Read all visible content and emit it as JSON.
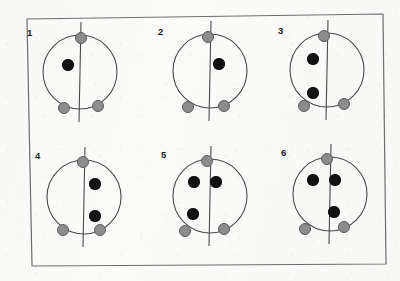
{
  "figure": {
    "width": 400,
    "height": 281,
    "background_color": "#fbfbfa",
    "frame": {
      "stroke_color": "#6e6e6e",
      "stroke_width": 1.2,
      "corners": [
        [
          27,
          19
        ],
        [
          383,
          14
        ],
        [
          386,
          264
        ],
        [
          32,
          266
        ]
      ]
    },
    "legend_colors": {
      "black_dot": "#111111",
      "gray_dot": "#8d8d8d",
      "gray_dot_outline": "#5d5d5d",
      "circle_stroke": "#4a4a4a",
      "midline_stroke": "#4a4a4a"
    },
    "geometry": {
      "circle_radius": 37,
      "black_dot_diameter": 12,
      "gray_dot_diameter": 12,
      "midline_overshoot": 13
    }
  },
  "panels": [
    {
      "label": "1",
      "label_x": 27,
      "label_y": 28,
      "center_x": 80,
      "center_y": 72,
      "radius": 37,
      "black_dot_count": 1,
      "gray_dot_count": 3,
      "black_dots": [
        {
          "x": 68,
          "y": 65,
          "name": "black-dot-left-upper"
        }
      ],
      "gray_dots": [
        {
          "x": 81,
          "y": 38,
          "name": "gray-dot-top"
        },
        {
          "x": 64,
          "y": 108,
          "name": "gray-dot-bottom-left"
        },
        {
          "x": 98,
          "y": 106,
          "name": "gray-dot-bottom-right"
        }
      ]
    },
    {
      "label": "2",
      "label_x": 158,
      "label_y": 27,
      "center_x": 210,
      "center_y": 71,
      "radius": 37,
      "black_dot_count": 1,
      "gray_dot_count": 3,
      "black_dots": [
        {
          "x": 219,
          "y": 64,
          "name": "black-dot-right-upper"
        }
      ],
      "gray_dots": [
        {
          "x": 208,
          "y": 37,
          "name": "gray-dot-top"
        },
        {
          "x": 188,
          "y": 107,
          "name": "gray-dot-bottom-left"
        },
        {
          "x": 224,
          "y": 106,
          "name": "gray-dot-bottom-right"
        }
      ]
    },
    {
      "label": "3",
      "label_x": 278,
      "label_y": 26,
      "center_x": 327,
      "center_y": 70,
      "radius": 37,
      "black_dot_count": 2,
      "gray_dot_count": 3,
      "black_dots": [
        {
          "x": 313,
          "y": 59,
          "name": "black-dot-left-upper"
        },
        {
          "x": 313,
          "y": 93,
          "name": "black-dot-left-lower"
        }
      ],
      "gray_dots": [
        {
          "x": 324,
          "y": 36,
          "name": "gray-dot-top"
        },
        {
          "x": 304,
          "y": 106,
          "name": "gray-dot-bottom-left"
        },
        {
          "x": 344,
          "y": 104,
          "name": "gray-dot-bottom-right"
        }
      ]
    },
    {
      "label": "4",
      "label_x": 35,
      "label_y": 151,
      "center_x": 84,
      "center_y": 197,
      "radius": 37,
      "black_dot_count": 2,
      "gray_dot_count": 3,
      "black_dots": [
        {
          "x": 95,
          "y": 184,
          "name": "black-dot-right-upper"
        },
        {
          "x": 95,
          "y": 216,
          "name": "black-dot-right-lower"
        }
      ],
      "gray_dots": [
        {
          "x": 83,
          "y": 162,
          "name": "gray-dot-top"
        },
        {
          "x": 63,
          "y": 230,
          "name": "gray-dot-bottom-left"
        },
        {
          "x": 100,
          "y": 230,
          "name": "gray-dot-bottom-right"
        }
      ]
    },
    {
      "label": "5",
      "label_x": 161,
      "label_y": 150,
      "center_x": 210,
      "center_y": 196,
      "radius": 37,
      "black_dot_count": 3,
      "gray_dot_count": 3,
      "black_dots": [
        {
          "x": 194,
          "y": 182,
          "name": "black-dot-upper-left"
        },
        {
          "x": 216,
          "y": 182,
          "name": "black-dot-upper-right"
        },
        {
          "x": 193,
          "y": 214,
          "name": "black-dot-lower-left"
        }
      ],
      "gray_dots": [
        {
          "x": 207,
          "y": 161,
          "name": "gray-dot-top"
        },
        {
          "x": 185,
          "y": 231,
          "name": "gray-dot-bottom-left"
        },
        {
          "x": 224,
          "y": 229,
          "name": "gray-dot-bottom-right"
        }
      ]
    },
    {
      "label": "6",
      "label_x": 281,
      "label_y": 148,
      "center_x": 330,
      "center_y": 194,
      "radius": 37,
      "black_dot_count": 3,
      "gray_dot_count": 3,
      "black_dots": [
        {
          "x": 313,
          "y": 180,
          "name": "black-dot-upper-left"
        },
        {
          "x": 335,
          "y": 180,
          "name": "black-dot-upper-right"
        },
        {
          "x": 334,
          "y": 212,
          "name": "black-dot-lower-right"
        }
      ],
      "gray_dots": [
        {
          "x": 327,
          "y": 159,
          "name": "gray-dot-top"
        },
        {
          "x": 305,
          "y": 229,
          "name": "gray-dot-bottom-left"
        },
        {
          "x": 344,
          "y": 227,
          "name": "gray-dot-bottom-right"
        }
      ]
    }
  ]
}
